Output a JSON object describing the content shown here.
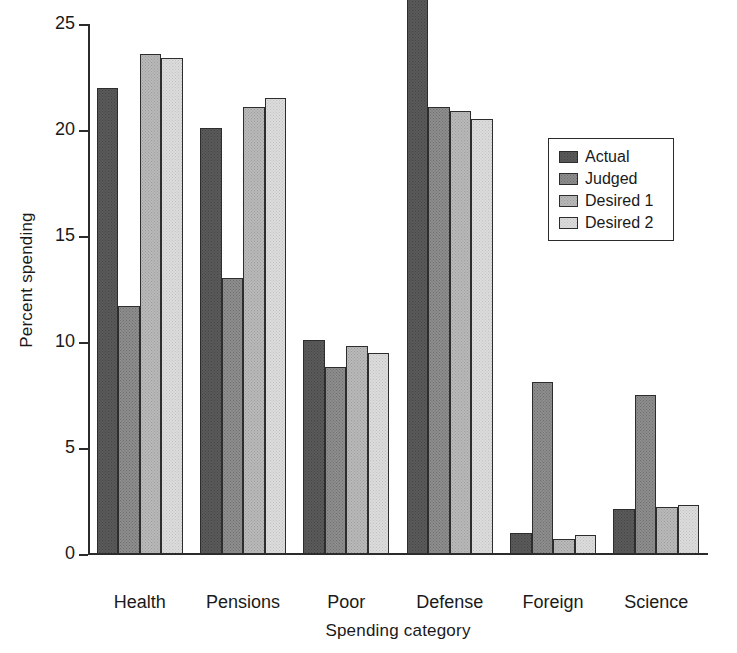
{
  "chart_data": {
    "type": "bar",
    "title": "",
    "xlabel": "Spending category",
    "ylabel": "Percent spending",
    "categories": [
      "Health",
      "Pensions",
      "Poor",
      "Defense",
      "Foreign",
      "Science"
    ],
    "series": [
      {
        "name": "Actual",
        "color": "#5a5a5a",
        "values": [
          22.0,
          20.1,
          10.1,
          26.2,
          1.0,
          2.1
        ]
      },
      {
        "name": "Judged",
        "color": "#8d8d8d",
        "values": [
          11.7,
          13.0,
          8.8,
          21.1,
          8.1,
          7.5
        ]
      },
      {
        "name": "Desired 1",
        "color": "#b9b9b9",
        "values": [
          23.6,
          21.1,
          9.8,
          20.9,
          0.7,
          2.2
        ]
      },
      {
        "name": "Desired 2",
        "color": "#dcdcdc",
        "values": [
          23.4,
          21.5,
          9.5,
          20.5,
          0.9,
          2.3
        ]
      }
    ],
    "ylim": [
      0,
      26.2
    ],
    "yticks": [
      0,
      5,
      10,
      15,
      20,
      25
    ],
    "ytick_labels": [
      "0",
      "5",
      "10",
      "15",
      "20",
      "25"
    ],
    "axis_max_value": 25,
    "grid": false,
    "legend_position": "right-upper",
    "legend_entries": [
      "Actual",
      "Judged",
      "Desired 1",
      "Desired 2"
    ]
  }
}
